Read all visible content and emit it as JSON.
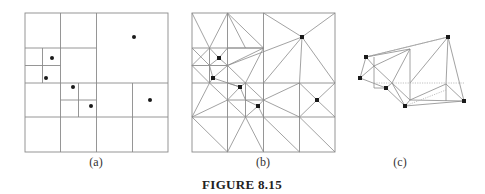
{
  "figure": {
    "caption": "FIGURE 8.15",
    "panels": [
      {
        "id": "a",
        "label": "(a)",
        "description": "quadtree subdivision of point set"
      },
      {
        "id": "b",
        "label": "(b)",
        "description": "triangulated quadtree mesh"
      },
      {
        "id": "c",
        "label": "(c)",
        "description": "resulting triangulation of point set"
      }
    ],
    "points_a": [
      [
        52,
        58
      ],
      [
        46,
        78
      ],
      [
        73,
        87
      ],
      [
        91,
        106
      ],
      [
        134,
        37
      ],
      [
        150,
        100
      ]
    ],
    "points_b": [
      [
        219,
        58
      ],
      [
        213,
        78
      ],
      [
        240,
        87
      ],
      [
        258,
        106
      ],
      [
        302,
        37
      ],
      [
        317,
        100
      ]
    ],
    "points_c": [
      [
        448,
        37
      ],
      [
        366,
        57
      ],
      [
        360,
        78
      ],
      [
        386,
        88
      ],
      [
        405,
        106
      ],
      [
        464,
        101
      ]
    ],
    "colors": {
      "lines": "#8a8a8a",
      "points": "#1a1a1a",
      "text": "#333333"
    }
  }
}
